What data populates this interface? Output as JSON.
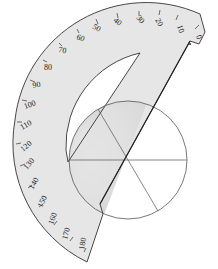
{
  "diagram": {
    "title": "",
    "protractor": {
      "scale_labels": [
        "0",
        "10",
        "20",
        "30",
        "40",
        "50",
        "60",
        "70",
        "80",
        "90",
        "100",
        "110",
        "120",
        "130",
        "140",
        "150",
        "160",
        "170",
        "180"
      ],
      "fill_color": "#e4e4e4",
      "edge_color": "#333333"
    },
    "circle": {
      "stroke_color": "#555555",
      "shade_color": "#c8c8c8",
      "divisions": 6
    }
  }
}
